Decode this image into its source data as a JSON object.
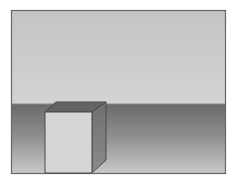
{
  "scene": {
    "description": "Open-top 3D box standing on a floor in front of a horizon",
    "colors": {
      "frame": "#6a6a6a",
      "sky_top": "#c4c4c4",
      "sky_bottom": "#d2d2d2",
      "floor_top": "#6c6c6c",
      "floor_bottom": "#c8c8c8",
      "box_front": "#d6d6d6",
      "box_side": "#7a7a7a",
      "box_inner": "#666666",
      "box_edge": "#4a4a4a"
    }
  }
}
